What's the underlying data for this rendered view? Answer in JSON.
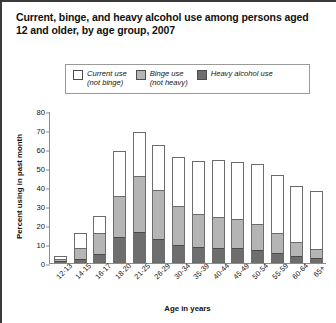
{
  "title": "Current, binge, and heavy alcohol use among persons aged 12 and older, by age group, 2007",
  "legend": {
    "items": [
      {
        "name": "current-use",
        "label": "Current use\n(not binge)",
        "color": "#ffffff"
      },
      {
        "name": "binge-use",
        "label": "Binge use\n(not heavy)",
        "color": "#b5b5b5"
      },
      {
        "name": "heavy-use",
        "label": "Heavy alcohol use",
        "color": "#6e6e6e"
      }
    ]
  },
  "chart_data": {
    "type": "bar",
    "stacked": true,
    "title": "Current, binge, and heavy alcohol use among persons aged 12 and older, by age group, 2007",
    "xlabel": "Age in years",
    "ylabel": "Percent using in past month",
    "ylim": [
      0,
      80
    ],
    "yticks": [
      0,
      10,
      20,
      30,
      40,
      50,
      60,
      70,
      80
    ],
    "grid": false,
    "legend_position": "top",
    "categories": [
      "12-13",
      "14-15",
      "16-17",
      "18-20",
      "21-25",
      "26-29",
      "30-34",
      "35-39",
      "40-44",
      "45-49",
      "50-54",
      "55-59",
      "60-64",
      "65+"
    ],
    "series": [
      {
        "name": "Heavy alcohol use",
        "color": "#6e6e6e",
        "values": [
          0.4,
          1.5,
          4.3,
          13.5,
          15.9,
          12.2,
          9.0,
          7.9,
          7.6,
          7.3,
          6.4,
          4.7,
          3.4,
          1.9
        ]
      },
      {
        "name": "Binge use (not heavy)",
        "color": "#b5b5b5",
        "values": [
          1.6,
          6.4,
          11.9,
          22.1,
          30.1,
          26.2,
          21.0,
          17.8,
          16.6,
          15.6,
          14.0,
          11.0,
          7.6,
          5.0
        ]
      },
      {
        "name": "Current use (not binge)",
        "color": "#ffffff",
        "values": [
          1.5,
          8.0,
          8.5,
          23.4,
          23.0,
          23.8,
          26.0,
          28.2,
          30.0,
          30.4,
          31.7,
          30.5,
          29.4,
          31.1
        ]
      }
    ],
    "totals": [
      3.5,
      15.9,
      24.7,
      59.0,
      69.0,
      62.2,
      56.0,
      53.9,
      54.2,
      53.3,
      52.1,
      46.2,
      40.4,
      38.0
    ]
  }
}
